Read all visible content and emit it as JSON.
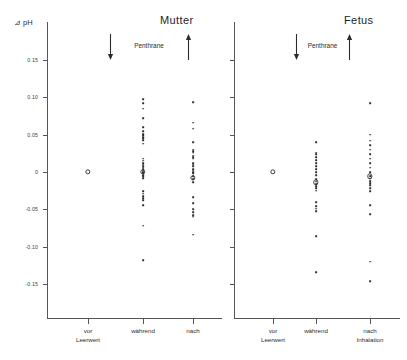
{
  "figure": {
    "y_axis_title": "⊿ pH",
    "panels": [
      {
        "id": "mother",
        "title": "Mutter",
        "treatment_label": "Penthrane",
        "x_categories": [
          "vor\nLeerwert",
          "während",
          "nach"
        ]
      },
      {
        "id": "fetus",
        "title": "Fetus",
        "treatment_label": "Penthrane",
        "x_categories": [
          "vor\nLeerwert",
          "während",
          "nach\nInhalation"
        ]
      }
    ]
  },
  "chart_data": {
    "type": "scatter",
    "xlabel": "",
    "ylabel": "⊿ pH",
    "ylim": [
      -0.17,
      0.17
    ],
    "yticks": [
      0.15,
      0.1,
      0.05,
      0,
      -0.05,
      -0.1,
      -0.15
    ],
    "ytick_labels": [
      "0.15",
      "0.10",
      "0.05",
      "0",
      "-0.05",
      "-0.10",
      "-0.15"
    ],
    "grid": false,
    "legend": null,
    "annotations": [
      {
        "text": "Penthrane",
        "panel": "mother",
        "meaning": "inhalation interval between down-arrow (start) and up-arrow (end)"
      },
      {
        "text": "Penthrane",
        "panel": "fetus",
        "meaning": "inhalation interval between down-arrow (start) and up-arrow (end)"
      }
    ],
    "panels": [
      {
        "name": "Mutter",
        "categories": [
          "vor Leerwert",
          "während",
          "nach"
        ],
        "series": [
          {
            "name": "vor Leerwert",
            "marker": "open-circle-mean",
            "mean": 0.0,
            "values": []
          },
          {
            "name": "während",
            "marker": "dot",
            "mean": 0.0,
            "values": [
              0.098,
              0.092,
              0.085,
              0.072,
              0.06,
              0.055,
              0.051,
              0.049,
              0.047,
              0.045,
              0.043,
              0.038,
              0.018,
              0.015,
              0.012,
              0.01,
              0.008,
              0.006,
              0.004,
              0.002,
              0.0,
              -0.002,
              -0.004,
              -0.006,
              -0.008,
              -0.026,
              -0.029,
              -0.032,
              -0.035,
              -0.038,
              -0.044,
              -0.072,
              -0.118
            ]
          },
          {
            "name": "nach",
            "marker": "dot",
            "mean": -0.008,
            "values": [
              0.094,
              0.066,
              0.058,
              0.04,
              0.03,
              0.028,
              0.026,
              0.022,
              0.02,
              0.018,
              0.012,
              0.01,
              0.008,
              0.004,
              0.002,
              0.0,
              -0.002,
              -0.006,
              -0.01,
              -0.014,
              -0.034,
              -0.042,
              -0.05,
              -0.054,
              -0.058,
              -0.06,
              -0.084
            ]
          }
        ]
      },
      {
        "name": "Fetus",
        "categories": [
          "vor Leerwert",
          "während",
          "nach Inhalation"
        ],
        "series": [
          {
            "name": "vor Leerwert",
            "marker": "open-circle-mean",
            "mean": 0.0,
            "values": []
          },
          {
            "name": "während",
            "marker": "dot",
            "mean": -0.014,
            "values": [
              0.04,
              0.026,
              0.024,
              0.02,
              0.016,
              0.012,
              0.008,
              0.004,
              0.0,
              -0.004,
              -0.01,
              -0.013,
              -0.016,
              -0.019,
              -0.022,
              -0.025,
              -0.04,
              -0.046,
              -0.049,
              -0.052,
              -0.086,
              -0.134
            ]
          },
          {
            "name": "nach Inhalation",
            "marker": "dot",
            "mean": -0.006,
            "values": [
              0.092,
              0.05,
              0.042,
              0.036,
              0.03,
              0.024,
              0.018,
              0.012,
              0.006,
              0.0,
              -0.006,
              -0.009,
              -0.012,
              -0.015,
              -0.018,
              -0.022,
              -0.026,
              -0.044,
              -0.056,
              -0.12,
              -0.146
            ]
          }
        ]
      }
    ]
  }
}
